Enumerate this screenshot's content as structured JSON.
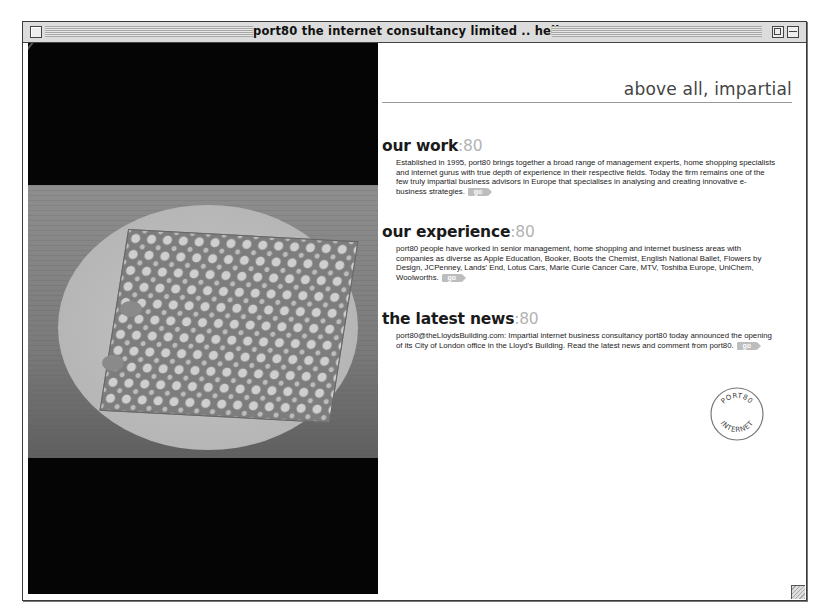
{
  "window": {
    "title": "port80 the internet consultancy limited .. hell...",
    "controls": [
      "close-box",
      "zoom-box",
      "collapse-box"
    ]
  },
  "hero_image": {
    "description": "Black-and-white photo of a perforated metal grid on a light circular disc against a dark background"
  },
  "tagline": "above all, impartial",
  "sections": [
    {
      "heading": "our work",
      "accent": ":80",
      "body": "Established in 1995, port80 brings together a broad range of management experts, home shopping specialists and internet gurus with true depth of experience in their respective fields. Today the firm remains one of the few truly impartial business advisors in Europe that specialises in analysing and creating innovative e-business strategies.",
      "go_label": "go"
    },
    {
      "heading": "our experience",
      "accent": ":80",
      "body": "port80 people have worked in senior management, home shopping and internet business areas with companies as diverse as Apple Education, Booker, Boots the Chemist, English National Ballet, Flowers by Design, JCPenney, Lands' End, Lotus Cars, Marie Curie Cancer Care, MTV, Toshiba Europe, UniChem, Woolworths.",
      "go_label": "go"
    },
    {
      "heading": "the latest news",
      "accent": ":80",
      "body": "port80@theLloydsBuilding.com: Impartial internet business consultancy port80 today announced the opening of its City of London office in the Lloyd's Building. Read the latest news and comment from port80.",
      "go_label": "go"
    }
  ],
  "stamp": {
    "top_text": "PORT80",
    "bottom_text": "INTERNET"
  },
  "colors": {
    "accent_grey": "#b3b3b3",
    "heading": "#1a1a1a",
    "photo_bg": "#050505"
  }
}
